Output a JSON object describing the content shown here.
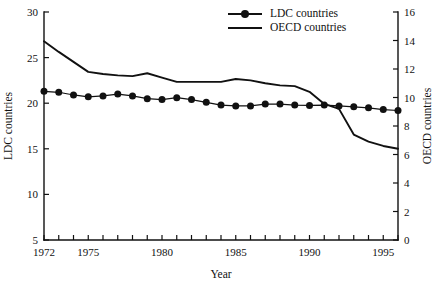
{
  "chart_data": {
    "type": "line",
    "title": "",
    "xlabel": "Year",
    "ylabel": "LDC countries",
    "y2label": "OECD countries",
    "xlim": [
      1972,
      1996
    ],
    "ylim": [
      5,
      30
    ],
    "y2lim": [
      0,
      16
    ],
    "grid": false,
    "legend_position": "top-center",
    "x_ticks_labeled": [
      "1972",
      "1975",
      "1980",
      "1985",
      "1990",
      "1995"
    ],
    "x_tick_values_labeled": [
      1972,
      1975,
      1980,
      1985,
      1990,
      1995
    ],
    "x_ticks_all": [
      1972,
      1973,
      1974,
      1975,
      1976,
      1977,
      1978,
      1979,
      1980,
      1981,
      1982,
      1983,
      1984,
      1985,
      1986,
      1987,
      1988,
      1989,
      1990,
      1991,
      1992,
      1993,
      1994,
      1995,
      1996
    ],
    "y_ticks": [
      5,
      10,
      15,
      20,
      25,
      30
    ],
    "y_tick_labels": [
      "5",
      "10",
      "15",
      "20",
      "25",
      "30"
    ],
    "y2_ticks": [
      0,
      2,
      4,
      6,
      8,
      10,
      12,
      14,
      16
    ],
    "y2_tick_labels": [
      "0",
      "2",
      "4",
      "6",
      "8",
      "10",
      "12",
      "14",
      "16"
    ],
    "x": [
      1972,
      1973,
      1974,
      1975,
      1976,
      1977,
      1978,
      1979,
      1980,
      1981,
      1982,
      1983,
      1984,
      1985,
      1986,
      1987,
      1988,
      1989,
      1990,
      1991,
      1992,
      1993,
      1994,
      1995,
      1996
    ],
    "series": [
      {
        "name": "LDC countries",
        "axis": "left",
        "marker": "filled-circle",
        "values": [
          21.3,
          21.2,
          20.9,
          20.7,
          20.8,
          21.0,
          20.8,
          20.5,
          20.4,
          20.6,
          20.4,
          20.1,
          19.8,
          19.7,
          19.7,
          19.9,
          19.9,
          19.8,
          19.75,
          19.8,
          19.7,
          19.6,
          19.5,
          19.3,
          19.2
        ]
      },
      {
        "name": "OECD countries",
        "axis": "right",
        "marker": "none",
        "values": [
          13.95,
          13.2,
          12.5,
          11.8,
          11.65,
          11.55,
          11.5,
          11.7,
          11.4,
          11.1,
          11.1,
          11.1,
          11.1,
          11.3,
          11.2,
          11.0,
          10.85,
          10.8,
          10.4,
          9.55,
          9.2,
          7.4,
          6.9,
          6.6,
          6.4
        ]
      }
    ]
  },
  "legend": {
    "entries": [
      {
        "label": "LDC countries",
        "marker": "filled-circle"
      },
      {
        "label": "OECD countries",
        "marker": "line"
      }
    ]
  }
}
